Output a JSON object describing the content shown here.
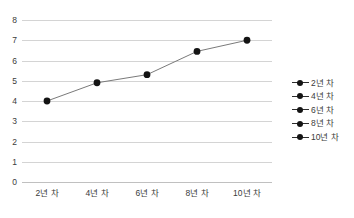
{
  "chart_data": {
    "type": "line",
    "title": "",
    "xlabel": "",
    "ylabel": "",
    "categories": [
      "2년 차",
      "4년 차",
      "6년 차",
      "8년 차",
      "10년 차"
    ],
    "values": [
      4.0,
      4.9,
      5.3,
      6.45,
      7.0
    ],
    "series": [
      {
        "name": "",
        "values": [
          4.0,
          4.9,
          5.3,
          6.45,
          7.0
        ]
      }
    ],
    "ylim": [
      0,
      8
    ],
    "yticks": [
      0,
      1,
      2,
      3,
      4,
      5,
      6,
      7,
      8
    ],
    "ytick_labels": [
      "0",
      "1",
      "2",
      "3",
      "4",
      "5",
      "6",
      "7",
      "8"
    ],
    "xtick_labels": [
      "2년 차",
      "4년 차",
      "6년 차",
      "8년 차",
      "10년 차"
    ],
    "grid": true,
    "grid_axis": "y",
    "legend_position": "right",
    "legend": [
      "2년 차",
      "4년 차",
      "6년 차",
      "8년 차",
      "10년 차"
    ],
    "marker": "circle",
    "colors": {
      "line": "#7a7a7a",
      "marker": "#141414",
      "grid": "#d4d4d4",
      "axis": "#c0c0c0",
      "text": "#3b3b3b",
      "background": "#ffffff"
    }
  }
}
